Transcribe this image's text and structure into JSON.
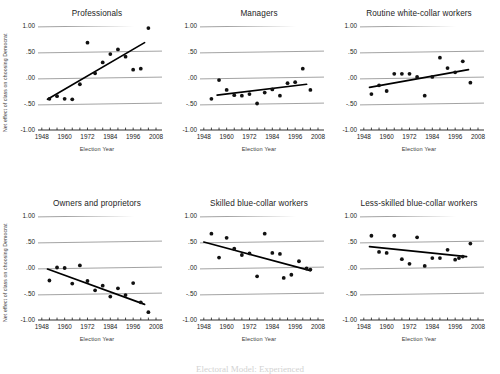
{
  "figure": {
    "ylabel": "Net effect of class on choosing Democrat",
    "xlabel": "Election Year",
    "footer": "Electoral Model: Experienced"
  },
  "axes": {
    "yticks": [
      "1.00",
      ".50",
      ".00",
      "-.50",
      "-1.00"
    ],
    "ytick_values": [
      1.0,
      0.5,
      0.0,
      -0.5,
      -1.0
    ],
    "xticks": [
      "1948",
      "1960",
      "1972",
      "1984",
      "1996",
      "2008"
    ],
    "xtick_values": [
      1948,
      1960,
      1972,
      1984,
      1996,
      2008
    ],
    "xlim": [
      1946,
      2008
    ],
    "ylim": [
      -1.0,
      1.0
    ],
    "gridlines": true,
    "grid_color": "#8c8c8c",
    "point_color": "#111111",
    "line_color": "#000000"
  },
  "chart_data": [
    {
      "type": "scatter",
      "title": "Professionals",
      "xlabel": "Election Year",
      "ylabel": "Net effect of class on choosing Democrat",
      "xlim": [
        1946,
        2008
      ],
      "ylim": [
        -1.0,
        1.0
      ],
      "points": [
        {
          "x": 1952,
          "y": -0.4
        },
        {
          "x": 1956,
          "y": -0.35
        },
        {
          "x": 1960,
          "y": -0.4
        },
        {
          "x": 1964,
          "y": -0.41
        },
        {
          "x": 1968,
          "y": -0.12
        },
        {
          "x": 1972,
          "y": 0.68
        },
        {
          "x": 1976,
          "y": 0.09
        },
        {
          "x": 1980,
          "y": 0.3
        },
        {
          "x": 1984,
          "y": 0.46
        },
        {
          "x": 1988,
          "y": 0.55
        },
        {
          "x": 1992,
          "y": 0.41
        },
        {
          "x": 1996,
          "y": 0.16
        },
        {
          "x": 2000,
          "y": 0.18
        },
        {
          "x": 2004,
          "y": 0.96
        }
      ],
      "fit_line": {
        "x0": 1951,
        "y0": -0.41,
        "x1": 2002,
        "y1": 0.68
      },
      "trend": "increasing"
    },
    {
      "type": "scatter",
      "title": "Managers",
      "xlabel": "Election Year",
      "ylabel": "",
      "xlim": [
        1946,
        2008
      ],
      "ylim": [
        -1.0,
        1.0
      ],
      "points": [
        {
          "x": 1952,
          "y": -0.4
        },
        {
          "x": 1956,
          "y": -0.04
        },
        {
          "x": 1960,
          "y": -0.23
        },
        {
          "x": 1964,
          "y": -0.33
        },
        {
          "x": 1968,
          "y": -0.34
        },
        {
          "x": 1972,
          "y": -0.31
        },
        {
          "x": 1976,
          "y": -0.49
        },
        {
          "x": 1980,
          "y": -0.28
        },
        {
          "x": 1984,
          "y": -0.22
        },
        {
          "x": 1988,
          "y": -0.34
        },
        {
          "x": 1992,
          "y": -0.1
        },
        {
          "x": 1996,
          "y": -0.08
        },
        {
          "x": 2000,
          "y": 0.18
        },
        {
          "x": 2004,
          "y": -0.23
        }
      ],
      "fit_line": {
        "x0": 1955,
        "y0": -0.33,
        "x1": 2002,
        "y1": -0.12
      },
      "trend": "increasing"
    },
    {
      "type": "scatter",
      "title": "Routine white-collar workers",
      "xlabel": "Election Year",
      "ylabel": "",
      "xlim": [
        1946,
        2008
      ],
      "ylim": [
        -1.0,
        1.0
      ],
      "points": [
        {
          "x": 1952,
          "y": -0.31
        },
        {
          "x": 1956,
          "y": -0.14
        },
        {
          "x": 1960,
          "y": -0.25
        },
        {
          "x": 1964,
          "y": 0.08
        },
        {
          "x": 1968,
          "y": 0.08
        },
        {
          "x": 1972,
          "y": 0.08
        },
        {
          "x": 1976,
          "y": 0.02
        },
        {
          "x": 1980,
          "y": -0.34
        },
        {
          "x": 1984,
          "y": 0.02
        },
        {
          "x": 1988,
          "y": 0.39
        },
        {
          "x": 1992,
          "y": 0.19
        },
        {
          "x": 1996,
          "y": 0.11
        },
        {
          "x": 2000,
          "y": 0.32
        },
        {
          "x": 2004,
          "y": -0.09
        }
      ],
      "fit_line": {
        "x0": 1951,
        "y0": -0.18,
        "x1": 2003,
        "y1": 0.16
      },
      "trend": "increasing"
    },
    {
      "type": "scatter",
      "title": "Owners and proprietors",
      "xlabel": "Election Year",
      "ylabel": "Net effect of class on choosing Democrat",
      "xlim": [
        1946,
        2008
      ],
      "ylim": [
        -1.0,
        1.0
      ],
      "points": [
        {
          "x": 1952,
          "y": -0.24
        },
        {
          "x": 1956,
          "y": 0.01
        },
        {
          "x": 1960,
          "y": 0.0
        },
        {
          "x": 1964,
          "y": -0.3
        },
        {
          "x": 1968,
          "y": 0.05
        },
        {
          "x": 1972,
          "y": -0.25
        },
        {
          "x": 1976,
          "y": -0.43
        },
        {
          "x": 1980,
          "y": -0.34
        },
        {
          "x": 1984,
          "y": -0.55
        },
        {
          "x": 1988,
          "y": -0.39
        },
        {
          "x": 1992,
          "y": -0.52
        },
        {
          "x": 1996,
          "y": -0.29
        },
        {
          "x": 2000,
          "y": -0.66
        },
        {
          "x": 2004,
          "y": -0.85
        }
      ],
      "fit_line": {
        "x0": 1951,
        "y0": -0.02,
        "x1": 2002,
        "y1": -0.7
      },
      "trend": "decreasing"
    },
    {
      "type": "scatter",
      "title": "Skilled blue-collar workers",
      "xlabel": "Election Year",
      "ylabel": "",
      "xlim": [
        1946,
        2008
      ],
      "ylim": [
        -1.0,
        1.0
      ],
      "points": [
        {
          "x": 1952,
          "y": 0.66
        },
        {
          "x": 1956,
          "y": 0.2
        },
        {
          "x": 1960,
          "y": 0.58
        },
        {
          "x": 1964,
          "y": 0.37
        },
        {
          "x": 1968,
          "y": 0.25
        },
        {
          "x": 1972,
          "y": 0.28
        },
        {
          "x": 1976,
          "y": -0.16
        },
        {
          "x": 1980,
          "y": 0.66
        },
        {
          "x": 1984,
          "y": 0.29
        },
        {
          "x": 1988,
          "y": 0.27
        },
        {
          "x": 1990,
          "y": -0.19
        },
        {
          "x": 1994,
          "y": -0.13
        },
        {
          "x": 1998,
          "y": 0.13
        },
        {
          "x": 2002,
          "y": -0.01
        },
        {
          "x": 2004,
          "y": -0.03
        }
      ],
      "fit_line": {
        "x0": 1948,
        "y0": 0.5,
        "x1": 2004,
        "y1": -0.05
      },
      "trend": "decreasing"
    },
    {
      "type": "scatter",
      "title": "Less-skilled blue-collar workers",
      "xlabel": "Election Year",
      "ylabel": "",
      "xlim": [
        1946,
        2008
      ],
      "ylim": [
        -1.0,
        1.0
      ],
      "points": [
        {
          "x": 1952,
          "y": 0.62
        },
        {
          "x": 1956,
          "y": 0.31
        },
        {
          "x": 1960,
          "y": 0.29
        },
        {
          "x": 1964,
          "y": 0.62
        },
        {
          "x": 1968,
          "y": 0.17
        },
        {
          "x": 1972,
          "y": 0.08
        },
        {
          "x": 1976,
          "y": 0.59
        },
        {
          "x": 1980,
          "y": 0.04
        },
        {
          "x": 1984,
          "y": 0.19
        },
        {
          "x": 1988,
          "y": 0.19
        },
        {
          "x": 1992,
          "y": 0.35
        },
        {
          "x": 1996,
          "y": 0.16
        },
        {
          "x": 1998,
          "y": 0.19
        },
        {
          "x": 2000,
          "y": 0.22
        },
        {
          "x": 2004,
          "y": 0.47
        }
      ],
      "fit_line": {
        "x0": 1951,
        "y0": 0.41,
        "x1": 2002,
        "y1": 0.22
      },
      "trend": "decreasing"
    }
  ]
}
